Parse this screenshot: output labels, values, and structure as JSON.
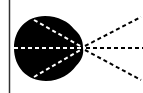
{
  "diagram": {
    "colors": {
      "background": "#ffffff",
      "blob": "#000000",
      "border": "#333333",
      "dash_inside": "#ffffff",
      "dash_outside": "#000000"
    },
    "focal_point": [
      83,
      48
    ],
    "rays": [
      {
        "name": "upper",
        "end": [
          141,
          17
        ]
      },
      {
        "name": "center",
        "end": [
          143,
          48
        ]
      },
      {
        "name": "lower",
        "end": [
          141,
          80
        ]
      }
    ],
    "inner_rays": [
      {
        "name": "upper-inner",
        "start": [
          34,
          20
        ]
      },
      {
        "name": "center-inner",
        "start": [
          14,
          48
        ]
      },
      {
        "name": "lower-inner",
        "start": [
          34,
          77
        ]
      }
    ]
  }
}
